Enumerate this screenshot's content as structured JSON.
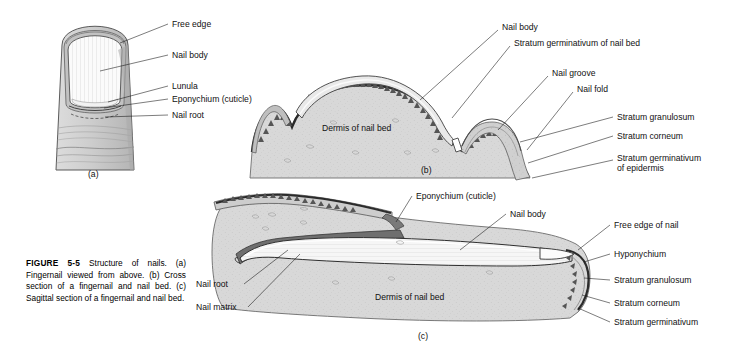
{
  "figure": {
    "caption_label": "FIGURE",
    "caption_number": "5-5",
    "caption_text": "Structure of nails. (a) Fingernail viewed from above. (b) Cross section of a fingernail and nail bed. (c) Sagittal section of a fingernail and nail bed."
  },
  "panels": {
    "a": {
      "id": "(a)",
      "title": "Fingernail viewed from above",
      "labels": [
        {
          "key": "free_edge",
          "text": "Free edge"
        },
        {
          "key": "nail_body",
          "text": "Nail body"
        },
        {
          "key": "lunula",
          "text": "Lunula"
        },
        {
          "key": "eponychium",
          "text": "Eponychium (cuticle)"
        },
        {
          "key": "nail_root",
          "text": "Nail root"
        }
      ]
    },
    "b": {
      "id": "(b)",
      "title": "Cross section of a fingernail and nail bed",
      "labels": [
        {
          "key": "nail_body",
          "text": "Nail body"
        },
        {
          "key": "strat_germ_nailbed",
          "text": "Stratum germinativum of nail bed"
        },
        {
          "key": "nail_groove",
          "text": "Nail groove"
        },
        {
          "key": "nail_fold",
          "text": "Nail fold"
        },
        {
          "key": "stratum_granulosum",
          "text": "Stratum granulosum"
        },
        {
          "key": "stratum_corneum",
          "text": "Stratum corneum"
        },
        {
          "key": "strat_germ_epi_l1",
          "text": "Stratum germinativum"
        },
        {
          "key": "strat_germ_epi_l2",
          "text": "of epidermis"
        },
        {
          "key": "dermis",
          "text": "Dermis of nail bed"
        }
      ]
    },
    "c": {
      "id": "(c)",
      "title": "Sagittal section of a fingernail and nail bed",
      "labels": [
        {
          "key": "eponychium",
          "text": "Eponychium (cuticle)"
        },
        {
          "key": "nail_body",
          "text": "Nail body"
        },
        {
          "key": "free_edge_of_nail",
          "text": "Free edge of nail"
        },
        {
          "key": "hyponychium",
          "text": "Hyponychium"
        },
        {
          "key": "stratum_granulosum",
          "text": "Stratum granulosum"
        },
        {
          "key": "stratum_corneum",
          "text": "Stratum corneum"
        },
        {
          "key": "stratum_germinativum",
          "text": "Stratum germinativum"
        },
        {
          "key": "nail_root",
          "text": "Nail root"
        },
        {
          "key": "nail_matrix",
          "text": "Nail matrix"
        },
        {
          "key": "dermis",
          "text": "Dermis of nail bed"
        }
      ]
    }
  },
  "colors": {
    "background": "#ffffff",
    "ink": "#111111",
    "dermis_fill": "#d8d8d8",
    "dermis_fill_dark": "#cccccc",
    "nail_plate": "#f4f4f4",
    "epidermis_dark": "#6e6e6e",
    "stratum_mid": "#a9a9a9",
    "finger_fill": "#cfcfcf",
    "nail_white": "#fbfbfb"
  }
}
